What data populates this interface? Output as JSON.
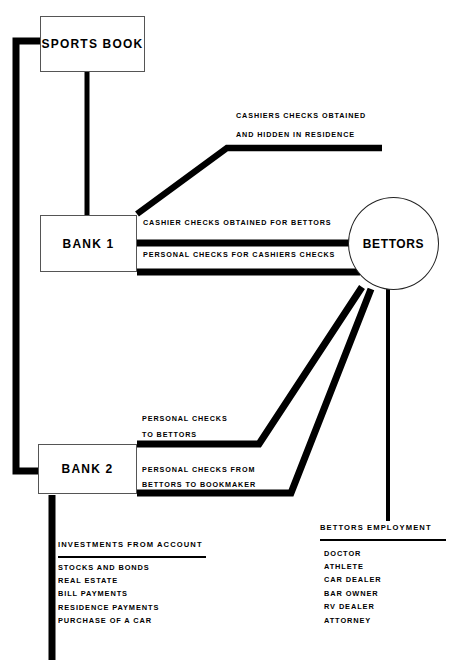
{
  "diagram": {
    "background_color": "#ffffff",
    "line_color": "#000000"
  },
  "nodes": {
    "sports_book": {
      "label": "SPORTS BOOK"
    },
    "bank_1": {
      "label": "BANK  1"
    },
    "bank_2": {
      "label": "BANK  2"
    },
    "bettors": {
      "label": "BETTORS"
    }
  },
  "flows": {
    "cashiers_hidden": {
      "line1": "CASHIERS CHECKS OBTAINED",
      "line2": "AND HIDDEN IN RESIDENCE"
    },
    "cashier_checks_for_bettors": {
      "line1": "CASHIER CHECKS OBTAINED FOR BETTORS"
    },
    "personal_for_cashiers": {
      "line1": "PERSONAL CHECKS FOR CASHIERS CHECKS"
    },
    "personal_to_bettors": {
      "line1": "PERSONAL CHECKS",
      "line2": "TO BETTORS"
    },
    "personal_from_bettors": {
      "line1": "PERSONAL CHECKS FROM",
      "line2": "BETTORS TO BOOKMAKER"
    }
  },
  "investments": {
    "title": "INVESTMENTS FROM ACCOUNT",
    "items": [
      "STOCKS AND BONDS",
      "REAL ESTATE",
      "BILL PAYMENTS",
      "RESIDENCE PAYMENTS",
      "PURCHASE OF A CAR"
    ]
  },
  "employment": {
    "title": "BETTORS EMPLOYMENT",
    "items": [
      "DOCTOR",
      "ATHLETE",
      "CAR DEALER",
      "BAR OWNER",
      "RV DEALER",
      "ATTORNEY"
    ]
  }
}
